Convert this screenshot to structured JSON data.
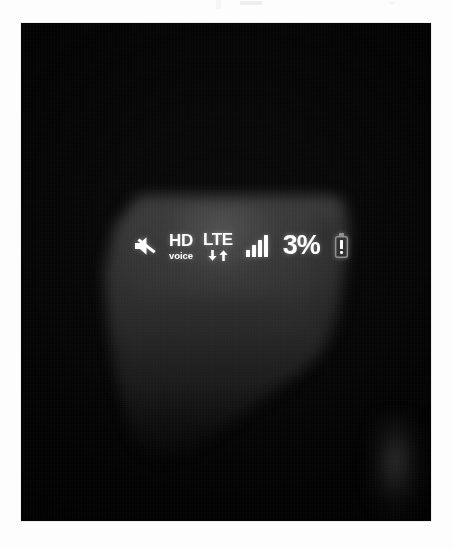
{
  "scene": {
    "description": "photograph-of-phone-screen",
    "frame_background": "#fdfdfd",
    "photo_background": "#020202"
  },
  "statusbar": {
    "mute": {
      "icon": "speaker-mute-icon",
      "label": "Mute"
    },
    "hd_voice": {
      "icon": "hd-voice-icon",
      "primary": "HD",
      "secondary": "voice"
    },
    "network": {
      "icon": "lte-icon",
      "label": "LTE",
      "download_arrow": "arrow-down-icon",
      "upload_arrow": "arrow-up-icon"
    },
    "signal": {
      "icon": "signal-bars-icon",
      "bars_total": 4,
      "bars_filled": 4
    },
    "battery": {
      "percent_label": "3%",
      "percent_value": 3,
      "icon": "battery-low-warning-icon",
      "warning": "!"
    },
    "text_color": "#ffffff"
  }
}
